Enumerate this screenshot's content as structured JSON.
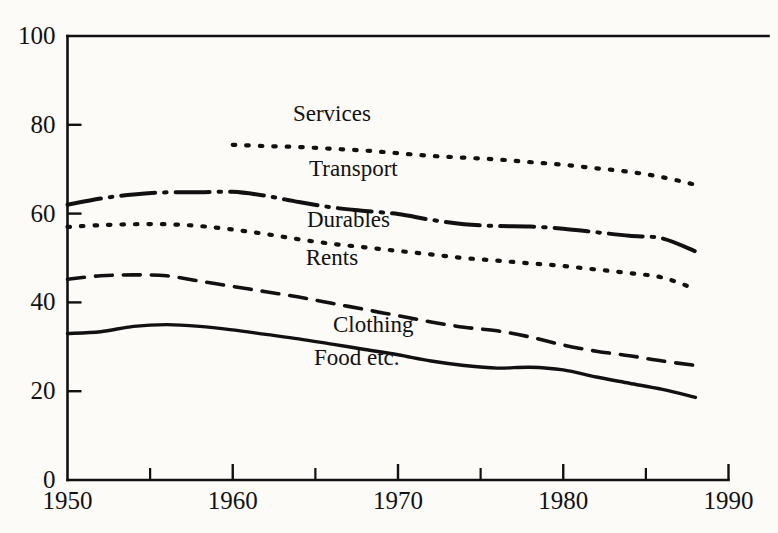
{
  "chart_data": {
    "type": "line",
    "title": "",
    "subtitle": "",
    "xlabel": "",
    "ylabel": "",
    "xlim": [
      1950,
      1990
    ],
    "ylim": [
      0,
      100
    ],
    "grid": false,
    "legend_position": "inline-labels",
    "x_ticks": [
      "1950",
      "1960",
      "1970",
      "1980",
      "1990"
    ],
    "x_tick_values": [
      1950,
      1960,
      1970,
      1980,
      1990
    ],
    "x_minor_tick_values": [
      1955,
      1965,
      1975,
      1985
    ],
    "y_ticks": [
      "0",
      "20",
      "40",
      "60",
      "80",
      "100"
    ],
    "y_tick_values": [
      0,
      20,
      40,
      60,
      80,
      100
    ],
    "series": [
      {
        "name": "Services",
        "style": "dotted",
        "label": "Services",
        "label_x": 1966.0,
        "label_y": 82.5,
        "x": [
          1960,
          1962,
          1964,
          1966,
          1968,
          1970,
          1972,
          1974,
          1976,
          1978,
          1980,
          1982,
          1984,
          1986,
          1988
        ],
        "values": [
          75.5,
          75.2,
          75.0,
          74.6,
          74.2,
          73.6,
          73.0,
          72.6,
          72.2,
          71.6,
          71.0,
          70.2,
          69.4,
          68.2,
          66.5
        ]
      },
      {
        "name": "Transport",
        "style": "dash-dot",
        "label": "Transport",
        "label_x": 1967.3,
        "label_y": 70.0,
        "x": [
          1950,
          1952,
          1954,
          1956,
          1958,
          1960,
          1962,
          1964,
          1966,
          1968,
          1970,
          1972,
          1974,
          1976,
          1978,
          1980,
          1982,
          1984,
          1986,
          1988
        ],
        "values": [
          62.0,
          63.4,
          64.3,
          64.8,
          64.8,
          64.9,
          64.0,
          62.6,
          61.4,
          60.6,
          59.9,
          58.6,
          57.6,
          57.2,
          57.1,
          56.6,
          55.8,
          55.0,
          54.4,
          51.5
        ]
      },
      {
        "name": "Durables",
        "style": "dotted",
        "label": "Durables",
        "label_x": 1967.0,
        "label_y": 58.5,
        "x": [
          1950,
          1952,
          1954,
          1956,
          1958,
          1960,
          1962,
          1964,
          1966,
          1968,
          1970,
          1972,
          1974,
          1976,
          1978,
          1980,
          1982,
          1984,
          1986,
          1988
        ],
        "values": [
          57.0,
          57.4,
          57.6,
          57.6,
          57.2,
          56.4,
          55.4,
          54.2,
          53.2,
          52.4,
          51.6,
          50.8,
          50.0,
          49.4,
          48.8,
          48.2,
          47.4,
          46.6,
          45.6,
          43.0
        ]
      },
      {
        "name": "Rents",
        "style": "label-only",
        "label": "Rents",
        "label_x": 1966.0,
        "label_y": 50.0,
        "x": [],
        "values": []
      },
      {
        "name": "Clothing",
        "style": "dashed",
        "label": "Clothing",
        "label_x": 1968.5,
        "label_y": 35.0,
        "x": [
          1950,
          1952,
          1954,
          1956,
          1958,
          1960,
          1962,
          1964,
          1966,
          1968,
          1970,
          1972,
          1974,
          1976,
          1978,
          1980,
          1982,
          1984,
          1986,
          1988
        ],
        "values": [
          45.2,
          46.0,
          46.2,
          46.0,
          44.8,
          43.6,
          42.4,
          41.2,
          39.8,
          38.4,
          37.0,
          35.6,
          34.4,
          33.6,
          32.2,
          30.4,
          29.0,
          28.0,
          26.8,
          25.8
        ]
      },
      {
        "name": "Food etc.",
        "style": "solid",
        "label": "Food etc.",
        "label_x": 1967.5,
        "label_y": 27.5,
        "x": [
          1950,
          1952,
          1954,
          1956,
          1958,
          1960,
          1962,
          1964,
          1966,
          1968,
          1970,
          1972,
          1974,
          1976,
          1978,
          1980,
          1982,
          1984,
          1986,
          1988
        ],
        "values": [
          33.0,
          33.4,
          34.6,
          35.0,
          34.6,
          33.8,
          32.8,
          31.8,
          30.6,
          29.4,
          28.2,
          26.8,
          25.8,
          25.2,
          25.4,
          24.8,
          23.2,
          21.8,
          20.4,
          18.6
        ]
      }
    ]
  },
  "colors": {
    "ink": "#111111",
    "paper": "#fcfbf8"
  }
}
